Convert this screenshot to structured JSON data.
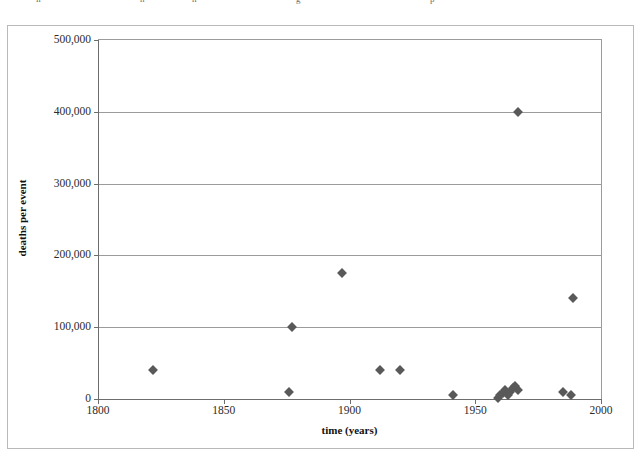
{
  "caption_fragments": [
    {
      "text": "ir",
      "x": 36
    },
    {
      "text": "h",
      "x": 140
    },
    {
      "text": "n",
      "x": 192
    },
    {
      "text": "g",
      "x": 296
    },
    {
      "text": "p",
      "x": 430
    }
  ],
  "chart_data": {
    "type": "scatter",
    "title": "",
    "xlabel": "time (years)",
    "ylabel": "deaths per event",
    "xlim": [
      1800,
      2000
    ],
    "ylim": [
      0,
      500000
    ],
    "xticks": [
      1800,
      1850,
      1900,
      1950,
      2000
    ],
    "xtick_labels": [
      "1800",
      "1850",
      "1900",
      "1950",
      "2000"
    ],
    "yticks": [
      0,
      100000,
      200000,
      300000,
      400000,
      500000
    ],
    "ytick_labels": [
      "0",
      "100,000",
      "200,000",
      "300,000",
      "400,000",
      "500,000"
    ],
    "grid": "horizontal",
    "legend": "none",
    "marker": "diamond",
    "marker_color": "#595959",
    "series": [
      {
        "name": "deaths per event",
        "points": [
          {
            "x": 1822,
            "y": 40000
          },
          {
            "x": 1876,
            "y": 10000
          },
          {
            "x": 1877,
            "y": 100000
          },
          {
            "x": 1897,
            "y": 175000
          },
          {
            "x": 1912,
            "y": 40000
          },
          {
            "x": 1920,
            "y": 40000
          },
          {
            "x": 1941,
            "y": 6000
          },
          {
            "x": 1959,
            "y": 2000
          },
          {
            "x": 1960,
            "y": 5000
          },
          {
            "x": 1961,
            "y": 8000
          },
          {
            "x": 1962,
            "y": 12000
          },
          {
            "x": 1963,
            "y": 6000
          },
          {
            "x": 1964,
            "y": 10000
          },
          {
            "x": 1965,
            "y": 15000
          },
          {
            "x": 1966,
            "y": 18000
          },
          {
            "x": 1967,
            "y": 12000
          },
          {
            "x": 1967,
            "y": 400000
          },
          {
            "x": 1985,
            "y": 10000
          },
          {
            "x": 1988,
            "y": 5000
          },
          {
            "x": 1989,
            "y": 140000
          }
        ]
      }
    ]
  }
}
